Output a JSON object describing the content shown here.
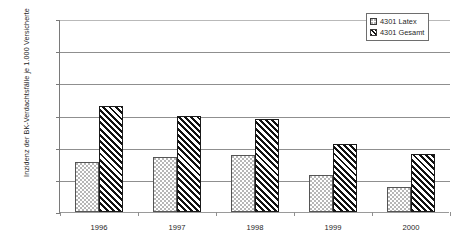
{
  "chart_data": {
    "type": "bar",
    "title": "",
    "xlabel": "",
    "ylabel": "Inzidenz der BK-Verdachtsfälle je 1.000 Versicherte",
    "categories": [
      "1996",
      "1997",
      "1998",
      "1999",
      "2000"
    ],
    "series": [
      {
        "name": "4301 Latex",
        "values": [
          0.155,
          0.17,
          0.178,
          0.115,
          0.078
        ],
        "pattern": "dotted"
      },
      {
        "name": "4301 Gesamt",
        "values": [
          0.33,
          0.3,
          0.29,
          0.21,
          0.18
        ],
        "pattern": "diagonal-hatch"
      }
    ],
    "ylim": [
      0,
      0.6
    ],
    "ytick_step": 0.1,
    "ytick_labels": [
      "0",
      "0,1",
      "0,2",
      "0,3",
      "0,4",
      "0,5",
      "0,6"
    ],
    "ytick_values": [
      0,
      0.1,
      0.2,
      0.3,
      0.4,
      0.5,
      0.6
    ],
    "grid": "horizontal",
    "legend_position": "top-right",
    "decimal_separator": ","
  },
  "legend": {
    "items": [
      {
        "label": "4301 Latex"
      },
      {
        "label": "4301 Gesamt"
      }
    ]
  },
  "colors": {
    "axis": "#7a7a7a",
    "grid": "#8f8f8f",
    "bar_outline": "#1a1a1a",
    "text": "#262626",
    "background": "#ffffff"
  }
}
